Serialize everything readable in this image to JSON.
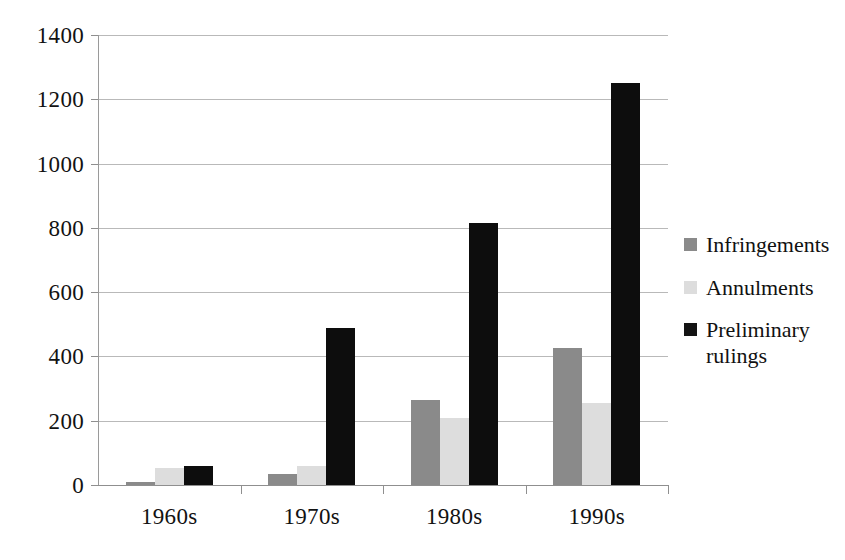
{
  "chart_data": {
    "type": "bar",
    "title": "",
    "subtitle": "",
    "xlabel": "",
    "ylabel": "",
    "categories": [
      "1960s",
      "1970s",
      "1980s",
      "1990s"
    ],
    "series": [
      {
        "name": "Infringements",
        "color": "#8a8a8a",
        "values": [
          10,
          35,
          265,
          425
        ]
      },
      {
        "name": "Annulments",
        "color": "#dddddd",
        "values": [
          52,
          58,
          207,
          255
        ]
      },
      {
        "name": "Preliminary rulings",
        "color": "#0d0d0d",
        "values": [
          60,
          490,
          815,
          1250
        ]
      }
    ],
    "ylim": [
      0,
      1400
    ],
    "ytick_step": 200,
    "yticks": [
      0,
      200,
      400,
      600,
      800,
      1000,
      1200,
      1400
    ],
    "ytick_labels": [
      "0",
      "200",
      "400",
      "600",
      "800",
      "1000",
      "1200",
      "1400"
    ],
    "grid": true,
    "grid_axis": "y",
    "legend_position": "right",
    "legend_entries": [
      {
        "label": "Infringements",
        "lines": [
          "Infringements"
        ],
        "swatch": "#8a8a8a"
      },
      {
        "label": "Annulments",
        "lines": [
          "Annulments"
        ],
        "swatch": "#dddddd"
      },
      {
        "label": "Preliminary rulings",
        "lines": [
          "Preliminary",
          "rulings"
        ],
        "swatch": "#141414"
      }
    ],
    "background_color": "#ffffff",
    "axis_color": "#8f8f8f",
    "gridline_color": "#b9b9b9"
  }
}
